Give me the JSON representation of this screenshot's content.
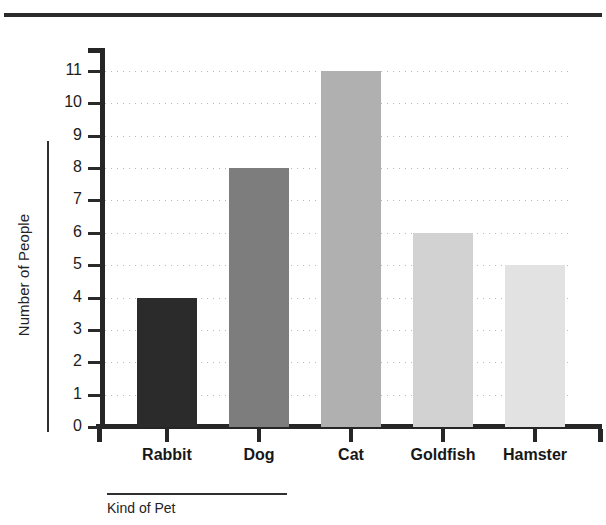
{
  "chart_data": {
    "type": "bar",
    "title": "",
    "xlabel": "Kind of Pet",
    "ylabel": "Number of People",
    "categories": [
      "Rabbit",
      "Dog",
      "Cat",
      "Goldfish",
      "Hamster"
    ],
    "values": [
      4,
      8,
      11,
      6,
      5
    ],
    "bar_colors": [
      "#2b2b2b",
      "#7d7d7d",
      "#b0b0b0",
      "#d2d2d2",
      "#e2e2e2"
    ],
    "ylim": [
      0,
      11
    ],
    "ytick_labels": [
      "0",
      "1",
      "2",
      "3",
      "4",
      "5",
      "6",
      "7",
      "8",
      "9",
      "10",
      "11"
    ],
    "ytick_values": [
      0,
      1,
      2,
      3,
      4,
      5,
      6,
      7,
      8,
      9,
      10,
      11
    ],
    "grid": true,
    "grid_axis": "y",
    "grid_style": "dotted",
    "grid_color": "#b9b9b9",
    "legend": null,
    "axis_color": "#262626",
    "background": "#ffffff"
  },
  "figure": {
    "top_rule_color": "#2b2b2b"
  }
}
